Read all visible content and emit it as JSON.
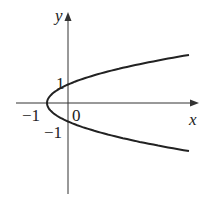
{
  "figure": {
    "equation": "x = y^2 - 1",
    "axes": {
      "x_label": "x",
      "y_label": "y"
    },
    "ticks": {
      "origin": "0",
      "x_neg_one": "−1",
      "y_pos_one": "1",
      "y_neg_one": "−1"
    },
    "curve": {
      "type": "parabola",
      "vertex": [
        -1,
        0
      ],
      "y_intercepts": [
        1,
        -1
      ],
      "opens": "right"
    }
  }
}
